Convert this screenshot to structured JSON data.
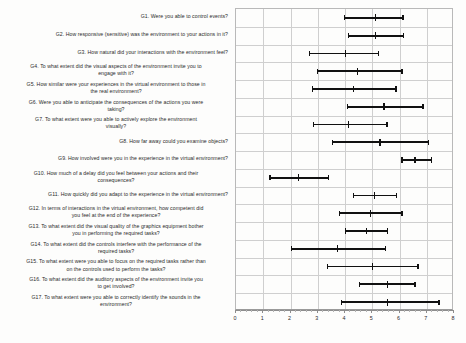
{
  "chart_data": {
    "type": "bar",
    "subtype": "horizontal-error-bars",
    "title": "",
    "xlabel": "",
    "ylabel": "",
    "xlim": [
      0,
      8
    ],
    "xticks": [
      0,
      1,
      2,
      3,
      4,
      5,
      6,
      7,
      8
    ],
    "xtick_labels": [
      "0",
      "1",
      "2",
      "3",
      "4",
      "5",
      "6",
      "7",
      "8"
    ],
    "minor_ticks_per_interval": 4,
    "grid": "vertical-and-horizontal",
    "legend": "none",
    "orientation": "horizontal",
    "categories": [
      "G1. Were you able to control events?",
      "G2. How responsive (sensitive) was the environment to your actions in it?",
      "G3. How natural did your interactions with the environment feel?",
      "G4. To what extent did the visual aspects of the environment invite you to engage with it?",
      "G5. How similar were your experiences in the virtual environment to those in the real environment?",
      "G6. Were you able to anticipate the consequences of the actions you were taking?",
      "G7. To what extent were you able to actively explore the environment visually?",
      "G8. How far away could you examine objects?",
      "G9. How involved were you in the experience in the virtual environment?",
      "G10. How much of a delay did you feel between your actions and their consequences?",
      "G11. How quickly did you adapt to the experience in the virtual environment?",
      "G12. In terms of interactions in the virtual environment, how competent did you feel at the end of the experience?",
      "G13. To what extent did the visual quality of the graphics equipment bother you in performing the required tasks?",
      "G14. To what extent did the controls interfere with the performance of the required tasks?",
      "G15. To what extent were you able to focus on the required tasks rather than on the controls used to perform the tasks?",
      "G16. To what extent did the auditory aspects of the environment invite you to get involved?",
      "G17. To what extent were you able to correctly identify the sounds in the environment?"
    ],
    "category_lines": [
      [
        "G1. Were you able to control events?"
      ],
      [
        "G2. How responsive (sensitive) was the environment to your actions in it?"
      ],
      [
        "G3. How natural did your interactions with the environment feel?"
      ],
      [
        "G4. To what extent did the visual aspects of the environment invite you to",
        "engage with it?"
      ],
      [
        "G5. How similar were your experiences in the virtual environment to those in",
        "the real environment?"
      ],
      [
        "G6. Were you able to anticipate the consequences of the actions you were",
        "taking?"
      ],
      [
        "G7. To what extent were you able to actively explore the environment",
        "visually?"
      ],
      [
        "G8. How far away could you examine objects?"
      ],
      [
        "G9. How involved were you in the experience in the virtual environment?"
      ],
      [
        "G10. How much of a delay did you feel between your actions and their",
        "consequences?"
      ],
      [
        "G11. How quickly did you adapt to the experience in the virtual environment?"
      ],
      [
        "G12. In terms of interactions in the virtual environment, how competent did",
        "you feel at the end of the experience?"
      ],
      [
        "G13. To what extent did the visual quality of the graphics equipment bother",
        "you in performing the required tasks?"
      ],
      [
        "G14. To what extent did the controls interfere with the performance of the",
        "required tasks?"
      ],
      [
        "G15. To what extent were you able to focus on the required tasks rather than",
        "on the controls used to perform the tasks?"
      ],
      [
        "G16. To what extent did the auditory aspects of the environment invite you",
        "to get involved?"
      ],
      [
        "G17. To what extent were you able to correctly identify the sounds in the",
        "environment?"
      ]
    ],
    "values": [
      5.13,
      5.13,
      4.03,
      4.47,
      4.32,
      5.43,
      4.13,
      5.28,
      6.57,
      2.29,
      5.09,
      4.94,
      4.8,
      3.73,
      5.02,
      5.57,
      5.57
    ],
    "lower": [
      3.99,
      4.13,
      2.69,
      2.99,
      2.8,
      4.1,
      2.84,
      3.54,
      6.09,
      1.25,
      4.32,
      3.8,
      4.02,
      2.03,
      3.36,
      4.54,
      3.87
    ],
    "upper": [
      6.13,
      6.16,
      5.24,
      6.09,
      5.87,
      6.86,
      5.54,
      7.05,
      7.16,
      3.39,
      5.9,
      6.09,
      5.57,
      5.5,
      6.68,
      6.57,
      7.45
    ],
    "series_name": "Mean with 95% confidence interval",
    "marker_color": "#111111"
  },
  "accessibility": {
    "chart_name": "presence-questionnaire-ci-chart"
  }
}
